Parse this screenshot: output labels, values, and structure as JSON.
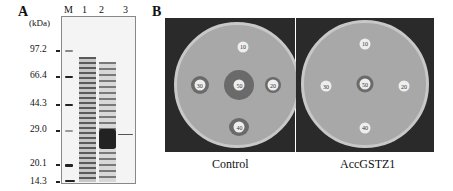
{
  "panelA": {
    "letter": "A",
    "unit": "(kDa)",
    "lanes": [
      "M",
      "1",
      "2",
      "3"
    ],
    "markers": [
      "97.2",
      "66.4",
      "44.3",
      "29.0",
      "20.1",
      "14.3"
    ]
  },
  "panelB": {
    "letter": "B",
    "plates": [
      {
        "caption": "Control",
        "discs": {
          "top": "10",
          "left": "30",
          "center": "50",
          "right": "20",
          "bottom": "40"
        }
      },
      {
        "caption": "AccGSTZ1",
        "discs": {
          "top": "10",
          "left": "30",
          "center": "50",
          "right": "20",
          "bottom": "40"
        }
      }
    ]
  }
}
